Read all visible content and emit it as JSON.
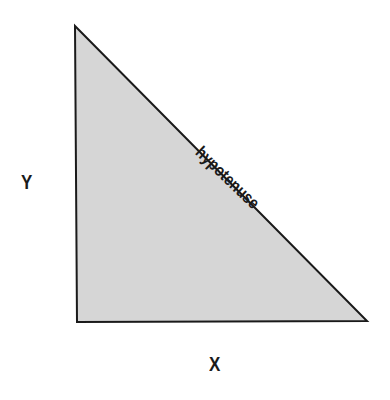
{
  "diagram": {
    "type": "right-triangle",
    "vertices": {
      "top": [
        75,
        26
      ],
      "bottom_left": [
        77,
        322
      ],
      "bottom_right": [
        367,
        321
      ]
    },
    "fill_color": "#d6d6d6",
    "stroke_color": "#1a1a1a",
    "labels": {
      "y_axis": "Y",
      "x_axis": "X",
      "hypotenuse": "hypotenuse"
    }
  }
}
